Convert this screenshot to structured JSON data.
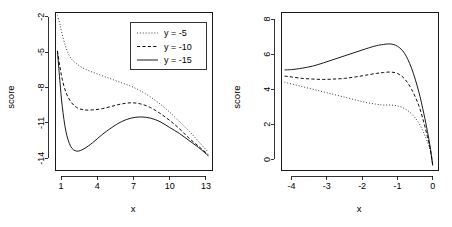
{
  "figure": {
    "panel_count": 2
  },
  "chart_data": [
    {
      "type": "line",
      "panel": "left",
      "title": "",
      "xlabel": "x",
      "ylabel": "score",
      "xlim": [
        0.5,
        13.5
      ],
      "ylim": [
        -15.0,
        -1.6
      ],
      "xticks": [
        1,
        4,
        7,
        10,
        13
      ],
      "xticklabels": [
        "1",
        "4",
        "7",
        "10",
        "13"
      ],
      "yticks": [
        -2,
        -5,
        -8,
        -11,
        -14
      ],
      "yticklabels": [
        "-2",
        "-5",
        "-8",
        "-11",
        "-14"
      ],
      "grid": false,
      "legend": {
        "position": "top-right",
        "entries": [
          {
            "label": "y =  -5",
            "style": "dotted"
          },
          {
            "label": "y = -10",
            "style": "dashed"
          },
          {
            "label": "y = -15",
            "style": "solid"
          }
        ]
      },
      "series": [
        {
          "name": "y =  -5",
          "style": "dotted",
          "x": [
            0.7,
            0.9,
            1.1,
            1.4,
            1.8,
            2.3,
            2.9,
            3.6,
            4.4,
            5.2,
            6.0,
            6.8,
            7.6,
            8.4,
            9.2,
            10.0,
            10.8,
            11.6,
            12.4,
            13.2
          ],
          "y": [
            -1.9,
            -2.6,
            -3.5,
            -4.6,
            -5.5,
            -6.0,
            -6.4,
            -6.7,
            -7.0,
            -7.3,
            -7.6,
            -7.9,
            -8.3,
            -8.8,
            -9.4,
            -10.1,
            -10.9,
            -11.7,
            -12.6,
            -13.5
          ]
        },
        {
          "name": "y = -10",
          "style": "dashed",
          "x": [
            0.7,
            0.9,
            1.1,
            1.4,
            1.8,
            2.3,
            2.9,
            3.6,
            4.4,
            5.2,
            6.0,
            6.8,
            7.6,
            8.4,
            9.2,
            10.0,
            10.8,
            11.6,
            12.4,
            13.2
          ],
          "y": [
            -4.9,
            -6.2,
            -7.3,
            -8.4,
            -9.2,
            -9.7,
            -9.9,
            -9.9,
            -9.8,
            -9.6,
            -9.4,
            -9.3,
            -9.4,
            -9.7,
            -10.2,
            -10.8,
            -11.5,
            -12.3,
            -13.0,
            -13.7
          ]
        },
        {
          "name": "y = -15",
          "style": "solid",
          "x": [
            0.7,
            0.9,
            1.1,
            1.4,
            1.8,
            2.3,
            2.9,
            3.6,
            4.4,
            5.2,
            6.0,
            6.8,
            7.6,
            8.4,
            9.2,
            10.0,
            10.8,
            11.6,
            12.4,
            13.2
          ],
          "y": [
            -4.9,
            -7.4,
            -9.6,
            -11.7,
            -13.0,
            -13.4,
            -13.2,
            -12.7,
            -12.0,
            -11.4,
            -10.9,
            -10.6,
            -10.5,
            -10.6,
            -10.9,
            -11.4,
            -11.9,
            -12.5,
            -13.1,
            -13.8
          ]
        }
      ]
    },
    {
      "type": "line",
      "panel": "right",
      "title": "",
      "xlabel": "x",
      "ylabel": "score",
      "xlim": [
        -4.3,
        0.15
      ],
      "ylim": [
        -0.6,
        8.4
      ],
      "xticks": [
        -4,
        -3,
        -2,
        -1,
        0
      ],
      "xticklabels": [
        "-4",
        "-3",
        "-2",
        "-1",
        "0"
      ],
      "yticks": [
        0,
        2,
        4,
        6,
        8
      ],
      "yticklabels": [
        "0",
        "2",
        "4",
        "6",
        "8"
      ],
      "grid": false,
      "legend": null,
      "series": [
        {
          "name": "y =  -5",
          "style": "dotted",
          "x": [
            -4.2,
            -4.0,
            -3.7,
            -3.4,
            -3.1,
            -2.8,
            -2.5,
            -2.2,
            -1.9,
            -1.6,
            -1.4,
            -1.2,
            -1.0,
            -0.8,
            -0.6,
            -0.4,
            -0.25,
            -0.15,
            -0.07,
            0.0
          ],
          "y": [
            4.4,
            4.3,
            4.15,
            4.0,
            3.85,
            3.7,
            3.55,
            3.4,
            3.25,
            3.15,
            3.1,
            3.1,
            3.05,
            2.9,
            2.6,
            2.1,
            1.5,
            1.0,
            0.5,
            -0.3
          ]
        },
        {
          "name": "y = -10",
          "style": "dashed",
          "x": [
            -4.2,
            -4.0,
            -3.7,
            -3.4,
            -3.1,
            -2.8,
            -2.5,
            -2.2,
            -1.9,
            -1.6,
            -1.4,
            -1.2,
            -1.0,
            -0.8,
            -0.6,
            -0.4,
            -0.25,
            -0.15,
            -0.07,
            0.0
          ],
          "y": [
            4.75,
            4.7,
            4.62,
            4.58,
            4.56,
            4.58,
            4.62,
            4.7,
            4.8,
            4.9,
            4.95,
            4.98,
            4.9,
            4.6,
            4.0,
            3.1,
            2.1,
            1.3,
            0.6,
            -0.3
          ]
        },
        {
          "name": "y = -15",
          "style": "solid",
          "x": [
            -4.2,
            -4.0,
            -3.7,
            -3.4,
            -3.1,
            -2.8,
            -2.5,
            -2.2,
            -1.9,
            -1.6,
            -1.4,
            -1.2,
            -1.0,
            -0.8,
            -0.6,
            -0.4,
            -0.25,
            -0.15,
            -0.07,
            0.0
          ],
          "y": [
            5.1,
            5.12,
            5.2,
            5.32,
            5.5,
            5.7,
            5.9,
            6.1,
            6.3,
            6.48,
            6.55,
            6.58,
            6.45,
            6.05,
            5.2,
            3.9,
            2.6,
            1.6,
            0.7,
            -0.35
          ]
        }
      ]
    }
  ]
}
